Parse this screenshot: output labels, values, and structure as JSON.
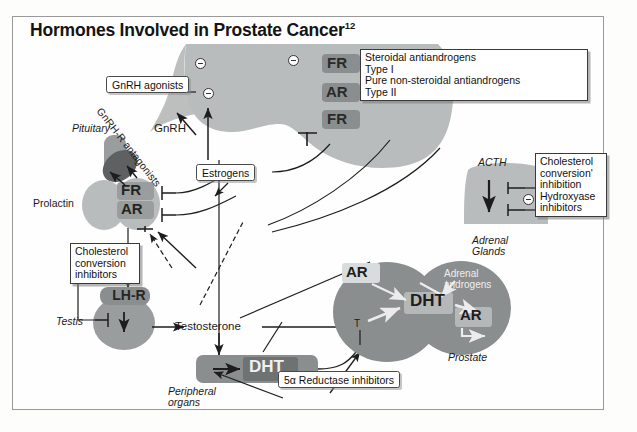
{
  "title": {
    "main": "Hormones Involved in Prostate Cancer",
    "superscript": "12"
  },
  "boxes": {
    "gnrh_agonists": "GnRH agonists",
    "estrogens": "Estrogens",
    "antiandrogens": {
      "line1": "Steroidal antiandrogens",
      "line2": "Type I",
      "line3": "Pure non-steroidal antiandrogens",
      "line4": "Type II"
    },
    "adrenal_inhibitors": {
      "line1": "Cholesterol",
      "line2": "conversion'",
      "line3": "inhibition",
      "line4": "Hydroxyase",
      "line5": "inhibitors"
    },
    "testis_inhibitors": {
      "line1": "Cholesterol",
      "line2": "conversion",
      "line3": "inhibitors"
    },
    "reductase": "5α Reductase inhibitors"
  },
  "labels": {
    "pituitary": "Pituitary",
    "gnrh": "GnRH",
    "gnrh_r_antagonists": "GnRH-R antagonists",
    "prolactin": "Prolactin",
    "testis": "Testis",
    "testosterone": "Testosterone",
    "peripheral_organs_l1": "Peripheral",
    "peripheral_organs_l2": "organs",
    "acth": "ACTH",
    "adrenal_glands_l1": "Adrenal",
    "adrenal_glands_l2": "Glands",
    "adrenal_androgens_l1": "Adrenal",
    "adrenal_androgens_l2": "androgens",
    "prostate": "Prostate",
    "t_marker": "T"
  },
  "receptors": {
    "hypo_fr_top": "FR",
    "hypo_ar": "AR",
    "hypo_fr_bottom": "FR",
    "pit_fr": "FR",
    "pit_ar": "AR",
    "lh_r": "LH-R",
    "prostate_ar_left": "AR",
    "prostate_ar_right": "AR",
    "dht_prostate": "DHT",
    "dht_peripheral": "DHT"
  },
  "colors": {
    "organ_light": "#b9bcbc",
    "organ_mid": "#9a9d9d",
    "organ_dark": "#6f7272",
    "pill": "#8e8e8e",
    "frame": "#9a9a9a",
    "ink": "#1a1a1a"
  },
  "icons": {
    "inhibition_circle": "circle-minus-icon",
    "arrow": "arrow-icon",
    "tee": "tee-inhibition-icon"
  }
}
